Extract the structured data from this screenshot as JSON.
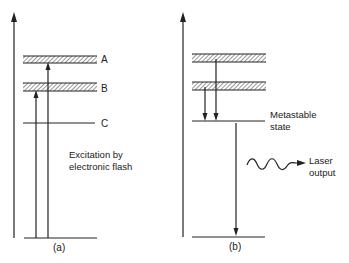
{
  "diagram": {
    "type": "energy-level-diagram",
    "panels": [
      {
        "id": "a",
        "caption": "(a)",
        "levels": [
          {
            "name": "band-A",
            "label": "A",
            "kind": "band"
          },
          {
            "name": "band-B",
            "label": "B",
            "kind": "band"
          },
          {
            "name": "level-C",
            "label": "C",
            "kind": "line"
          },
          {
            "name": "ground",
            "label": "",
            "kind": "line"
          }
        ],
        "transitions": [
          {
            "from": "ground",
            "to": "band-B",
            "direction": "up"
          },
          {
            "from": "ground",
            "to": "band-A",
            "direction": "up"
          }
        ],
        "annotation": [
          "Excitation by",
          "electronic flash"
        ]
      },
      {
        "id": "b",
        "caption": "(b)",
        "levels": [
          {
            "name": "band-upper",
            "label": "",
            "kind": "band"
          },
          {
            "name": "band-lower",
            "label": "",
            "kind": "band"
          },
          {
            "name": "metastable",
            "label": "Metastable state",
            "kind": "line"
          },
          {
            "name": "ground",
            "label": "",
            "kind": "line"
          }
        ],
        "transitions": [
          {
            "from": "band-lower",
            "to": "metastable",
            "direction": "down"
          },
          {
            "from": "band-upper",
            "to": "metastable",
            "direction": "down"
          },
          {
            "from": "metastable",
            "to": "ground",
            "direction": "down"
          }
        ],
        "metastable_label": [
          "Metastable",
          "state"
        ],
        "laser_label": [
          "Laser",
          "output"
        ]
      }
    ]
  }
}
